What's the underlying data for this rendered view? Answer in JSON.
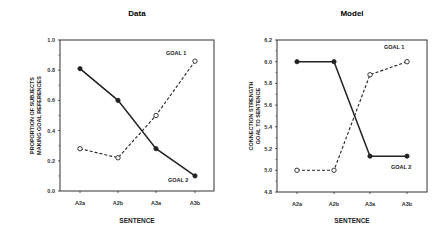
{
  "chart_data": [
    {
      "type": "line",
      "title": "Data",
      "xlabel": "SENTENCE",
      "ylabel": "PROPORTION OF SUBJECTS MAKING GOAL REFERENCES",
      "ylabel_lines": [
        "PROPORTION OF SUBJECTS",
        "MAKING GOAL REFERENCES"
      ],
      "categories": [
        "A2a",
        "A2b",
        "A3a",
        "A3b"
      ],
      "ylim": [
        0.0,
        1.0
      ],
      "yticks": [
        "0.0",
        "0.2",
        "0.4",
        "0.6",
        "0.8",
        "1.0"
      ],
      "grid": false,
      "series": [
        {
          "name": "GOAL 1",
          "style": "solid",
          "marker": "filled-circle",
          "values": [
            0.81,
            0.6,
            0.28,
            0.1
          ]
        },
        {
          "name": "GOAL 2",
          "style": "dashed",
          "marker": "open-circle",
          "values": [
            0.28,
            0.22,
            0.5,
            0.86
          ]
        }
      ],
      "annotations": [
        {
          "text": "GOAL 1",
          "position": "upper-right"
        },
        {
          "text": "GOAL 2",
          "position": "lower-right"
        }
      ]
    },
    {
      "type": "line",
      "title": "Model",
      "xlabel": "SENTENCE",
      "ylabel": "CONNECTION STRENGTH GOAL TO SENTENCE",
      "ylabel_lines": [
        "CONNECTION STRENGTH",
        "GOAL TO SENTENCE"
      ],
      "categories": [
        "A2a",
        "A2b",
        "A3a",
        "A3b"
      ],
      "ylim": [
        4.8,
        6.2
      ],
      "yticks": [
        "4.8",
        "5.0",
        "5.2",
        "5.4",
        "5.6",
        "5.8",
        "6.0",
        "6.2"
      ],
      "grid": false,
      "series": [
        {
          "name": "GOAL 1",
          "style": "dashed",
          "marker": "open-circle",
          "values": [
            5.0,
            5.0,
            5.88,
            6.0
          ]
        },
        {
          "name": "GOAL 2",
          "style": "solid",
          "marker": "filled-circle",
          "values": [
            6.0,
            6.0,
            5.13,
            5.13
          ]
        }
      ],
      "annotations": [
        {
          "text": "GOAL 1",
          "position": "upper-right"
        },
        {
          "text": "GOAL 2",
          "position": "lower-right"
        }
      ]
    }
  ]
}
